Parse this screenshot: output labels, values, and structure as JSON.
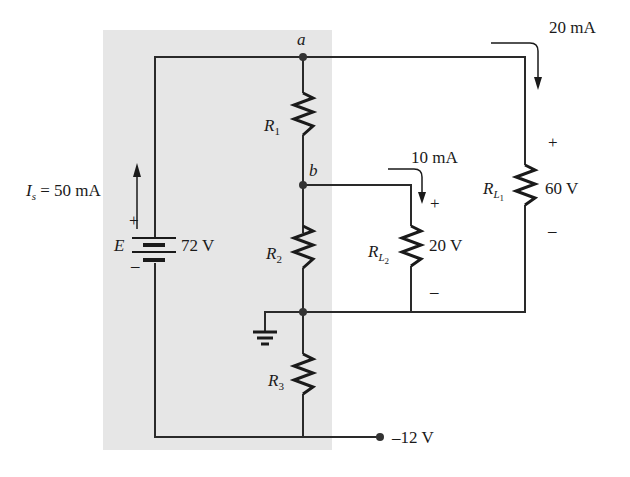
{
  "figure": {
    "shaded_region_color": "#e6e6e6",
    "wire_color": "#2a2a2a"
  },
  "nodes": {
    "a": "a",
    "b": "b"
  },
  "source": {
    "name": "E",
    "voltage": "72 V",
    "plus": "+",
    "minus": "–",
    "current_label": "I",
    "current_sub": "s",
    "current_value": "= 50 mA"
  },
  "resistors": {
    "r1": {
      "label": "R",
      "sub": "1"
    },
    "r2": {
      "label": "R",
      "sub": "2"
    },
    "r3": {
      "label": "R",
      "sub": "3"
    }
  },
  "loads": {
    "rl1": {
      "label": "R",
      "sub": "L",
      "subsub": "1",
      "voltage": "60 V",
      "current": "20 mA",
      "plus": "+",
      "minus": "–"
    },
    "rl2": {
      "label": "R",
      "sub": "L",
      "subsub": "2",
      "voltage": "20 V",
      "current": "10 mA",
      "plus": "+",
      "minus": "–"
    }
  },
  "terminal": {
    "voltage": "–12 V"
  }
}
